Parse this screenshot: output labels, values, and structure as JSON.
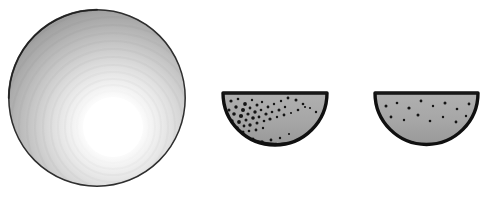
{
  "figure": {
    "background_color": "#ffffff",
    "width": 496,
    "height": 197,
    "panel_count": 3
  },
  "colors": {
    "background": "#ffffff",
    "outline": "#121212",
    "bowl_fill": "#a8a8a8",
    "bowl_fill_dark": "#9a9a9a",
    "sediment_fill": "#9f9f9f",
    "highlight_white": "#ffffff",
    "sphere_rim": "#3a3a3a",
    "sphere_outer_gray": "#8e8e8e",
    "speck_color": "#151515",
    "inner_arc_light": "#f2f2f2"
  },
  "panels": [
    {
      "id": "sphere-panel",
      "name": "large-shaded-sphere",
      "label": "Large shaded sphere with central highlight",
      "shape": "circle",
      "center_x": 97,
      "center_y": 98,
      "radius_x": 89,
      "radius_y": 89,
      "highlight_center_x": 113,
      "highlight_center_y": 127,
      "highlight_radius": 34,
      "rim_stroke_width": 1.6,
      "gradient_stops": [
        {
          "offset": 0.0,
          "color": "#ffffff"
        },
        {
          "offset": 0.16,
          "color": "#fdfdfd"
        },
        {
          "offset": 0.3,
          "color": "#f0f0f0"
        },
        {
          "offset": 0.44,
          "color": "#dedede"
        },
        {
          "offset": 0.58,
          "color": "#c8c8c8"
        },
        {
          "offset": 0.72,
          "color": "#b2b2b2"
        },
        {
          "offset": 0.86,
          "color": "#9d9d9d"
        },
        {
          "offset": 1.0,
          "color": "#8a8a8a"
        }
      ],
      "ring_count": 22,
      "speck_count": 0
    },
    {
      "id": "bowl-dense-panel",
      "name": "hemisphere-dense-particles",
      "label": "Hemispherical section with dense particle suspension",
      "shape": "half-disc",
      "rim_left_x": 223,
      "rim_right_x": 327,
      "rim_y": 93,
      "bottom_y": 156,
      "outline_width": 3.4,
      "inner_arc": {
        "start_x": 231,
        "start_y": 132,
        "control_x": 277,
        "control_y": 161,
        "end_x": 322,
        "end_y": 133,
        "band_width": 3.2,
        "band_color": "#f4f4f4"
      },
      "speck_count": 52,
      "speck_density": "high",
      "speck_region": "upper-left-concentrated"
    },
    {
      "id": "bowl-sparse-panel",
      "name": "hemisphere-sparse-particles",
      "label": "Hemispherical section with sparse particle suspension",
      "shape": "half-disc",
      "rim_left_x": 375,
      "rim_right_x": 478,
      "rim_y": 93,
      "bottom_y": 156,
      "outline_width": 3.4,
      "inner_arc": {
        "start_x": 382,
        "start_y": 133,
        "control_x": 428,
        "control_y": 162,
        "end_x": 473,
        "end_y": 132,
        "band_width": 3.4,
        "band_color": "#f4f4f4"
      },
      "speck_count": 16,
      "speck_density": "low",
      "speck_region": "evenly-scattered"
    }
  ],
  "speckles": {
    "dense": [
      [
        231,
        101,
        1.6
      ],
      [
        238,
        99,
        1.3
      ],
      [
        245,
        104,
        1.9
      ],
      [
        252,
        100,
        1.2
      ],
      [
        236,
        107,
        1.7
      ],
      [
        243,
        110,
        2.0
      ],
      [
        250,
        108,
        1.4
      ],
      [
        257,
        105,
        1.5
      ],
      [
        262,
        102,
        1.2
      ],
      [
        229,
        110,
        1.5
      ],
      [
        234,
        114,
        1.8
      ],
      [
        241,
        116,
        2.1
      ],
      [
        248,
        114,
        1.6
      ],
      [
        255,
        112,
        1.7
      ],
      [
        261,
        110,
        1.3
      ],
      [
        268,
        107,
        1.4
      ],
      [
        274,
        104,
        1.2
      ],
      [
        227,
        117,
        1.4
      ],
      [
        232,
        121,
        1.7
      ],
      [
        239,
        122,
        1.9
      ],
      [
        246,
        120,
        1.5
      ],
      [
        253,
        118,
        1.8
      ],
      [
        259,
        117,
        1.4
      ],
      [
        266,
        114,
        1.6
      ],
      [
        272,
        112,
        1.3
      ],
      [
        279,
        110,
        1.5
      ],
      [
        285,
        107,
        1.2
      ],
      [
        231,
        127,
        1.6
      ],
      [
        237,
        128,
        1.8
      ],
      [
        244,
        126,
        1.4
      ],
      [
        250,
        125,
        1.7
      ],
      [
        257,
        123,
        1.5
      ],
      [
        264,
        121,
        1.3
      ],
      [
        270,
        119,
        1.6
      ],
      [
        277,
        117,
        1.2
      ],
      [
        284,
        115,
        1.4
      ],
      [
        291,
        113,
        1.1
      ],
      [
        298,
        110,
        1.3
      ],
      [
        305,
        107,
        1.1
      ],
      [
        243,
        132,
        1.5
      ],
      [
        249,
        131,
        1.3
      ],
      [
        256,
        130,
        1.4
      ],
      [
        263,
        128,
        1.2
      ],
      [
        296,
        100,
        1.5
      ],
      [
        303,
        104,
        1.3
      ],
      [
        310,
        108,
        1.1
      ],
      [
        316,
        112,
        1.2
      ],
      [
        288,
        98,
        1.4
      ],
      [
        281,
        101,
        1.2
      ],
      [
        253,
        139,
        1.5
      ],
      [
        262,
        142,
        1.7
      ],
      [
        271,
        140,
        1.4
      ],
      [
        280,
        138,
        1.2
      ],
      [
        247,
        143,
        1.6
      ],
      [
        258,
        147,
        1.3
      ],
      [
        266,
        146,
        1.5
      ],
      [
        276,
        144,
        1.2
      ],
      [
        289,
        134,
        1.1
      ]
    ],
    "sparse": [
      [
        386,
        106,
        1.5
      ],
      [
        397,
        103,
        1.3
      ],
      [
        409,
        108,
        1.6
      ],
      [
        421,
        101,
        1.4
      ],
      [
        433,
        106,
        1.2
      ],
      [
        445,
        103,
        1.5
      ],
      [
        457,
        109,
        1.3
      ],
      [
        469,
        104,
        1.4
      ],
      [
        391,
        117,
        1.4
      ],
      [
        404,
        120,
        1.2
      ],
      [
        418,
        115,
        1.5
      ],
      [
        430,
        121,
        1.3
      ],
      [
        443,
        117,
        1.2
      ],
      [
        456,
        122,
        1.4
      ],
      [
        466,
        116,
        1.2
      ],
      [
        384,
        126,
        1.3
      ],
      [
        413,
        143,
        1.4
      ],
      [
        427,
        147,
        1.2
      ],
      [
        441,
        144,
        1.3
      ]
    ]
  },
  "accessibility": {
    "alt_text": "Scientific figure: a large radially shaded sphere on the left, and two hemispherical bowl cross-sections, the middle one densely speckled with particles and the right one sparsely speckled."
  }
}
